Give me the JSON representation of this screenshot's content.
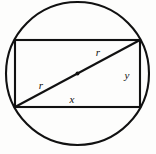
{
  "figure": {
    "background_color": "#fdfdfc",
    "stroke_color": "#111111",
    "circle": {
      "name": "circumscribed-circle",
      "center_x": 77.5,
      "center_y": 73.5,
      "radius": 71.5,
      "stroke_width": 2.1,
      "fill": "none"
    },
    "rectangle": {
      "name": "inscribed-rectangle",
      "left": 15,
      "top": 40,
      "right": 140,
      "bottom": 107,
      "width": 125,
      "height": 67,
      "stroke_width": 2.1,
      "fill": "none"
    },
    "diagonal": {
      "name": "diameter-diagonal",
      "x1": 15,
      "y1": 107,
      "x2": 140,
      "y2": 40,
      "stroke_width": 2.1
    },
    "center_dot": {
      "name": "circle-center-point",
      "cx": 77.5,
      "cy": 73.5,
      "r": 2.0
    },
    "labels": [
      {
        "name": "label-radius-upper",
        "text": "r",
        "x": 98,
        "y": 56
      },
      {
        "name": "label-radius-lower",
        "text": "r",
        "x": 41,
        "y": 89
      },
      {
        "name": "label-width-x",
        "text": "x",
        "x": 72,
        "y": 103
      },
      {
        "name": "label-height-y",
        "text": "y",
        "x": 127,
        "y": 79
      }
    ],
    "caption": ""
  }
}
